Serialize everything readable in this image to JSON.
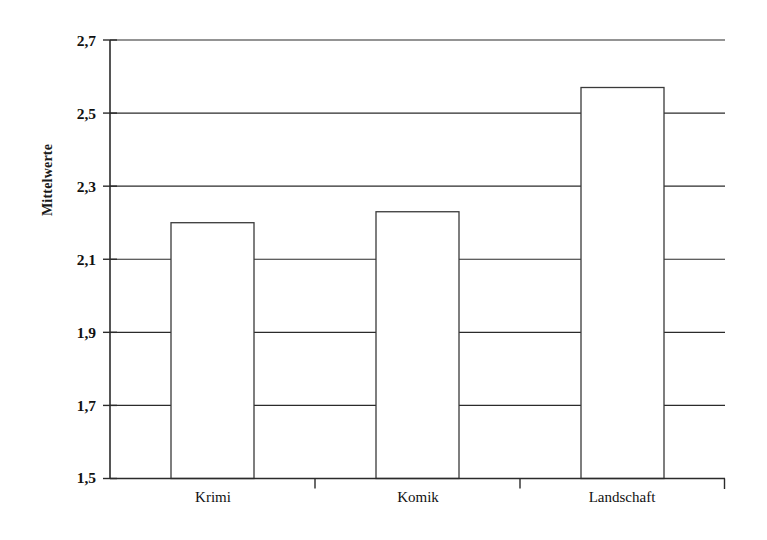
{
  "chart_data": {
    "type": "bar",
    "title": "",
    "subtitle": "",
    "xlabel": "",
    "ylabel": "Mittelwerte",
    "categories": [
      "Krimi",
      "Komik",
      "Landschaft"
    ],
    "values": [
      2.2,
      2.23,
      2.57
    ],
    "series": [
      {
        "name": "Mittelwerte",
        "values": [
          2.2,
          2.23,
          2.57
        ]
      }
    ],
    "ylim": [
      1.5,
      2.7
    ],
    "xlim": [
      0,
      3
    ],
    "ytick_labels": [
      "2,7",
      "2,5",
      "2,3",
      "2,1",
      "1,9",
      "1,7",
      "1,5"
    ],
    "ytick_values": [
      2.7,
      2.5,
      2.3,
      2.1,
      1.9,
      1.7,
      1.5
    ],
    "grid": true,
    "grid_axis": "y",
    "legend": false,
    "legend_position": "none",
    "bar_fill": "#ffffff",
    "bar_stroke": "#3a3a3a",
    "axis_color": "#2b2b2b",
    "background": "#ffffff",
    "annotations": []
  }
}
